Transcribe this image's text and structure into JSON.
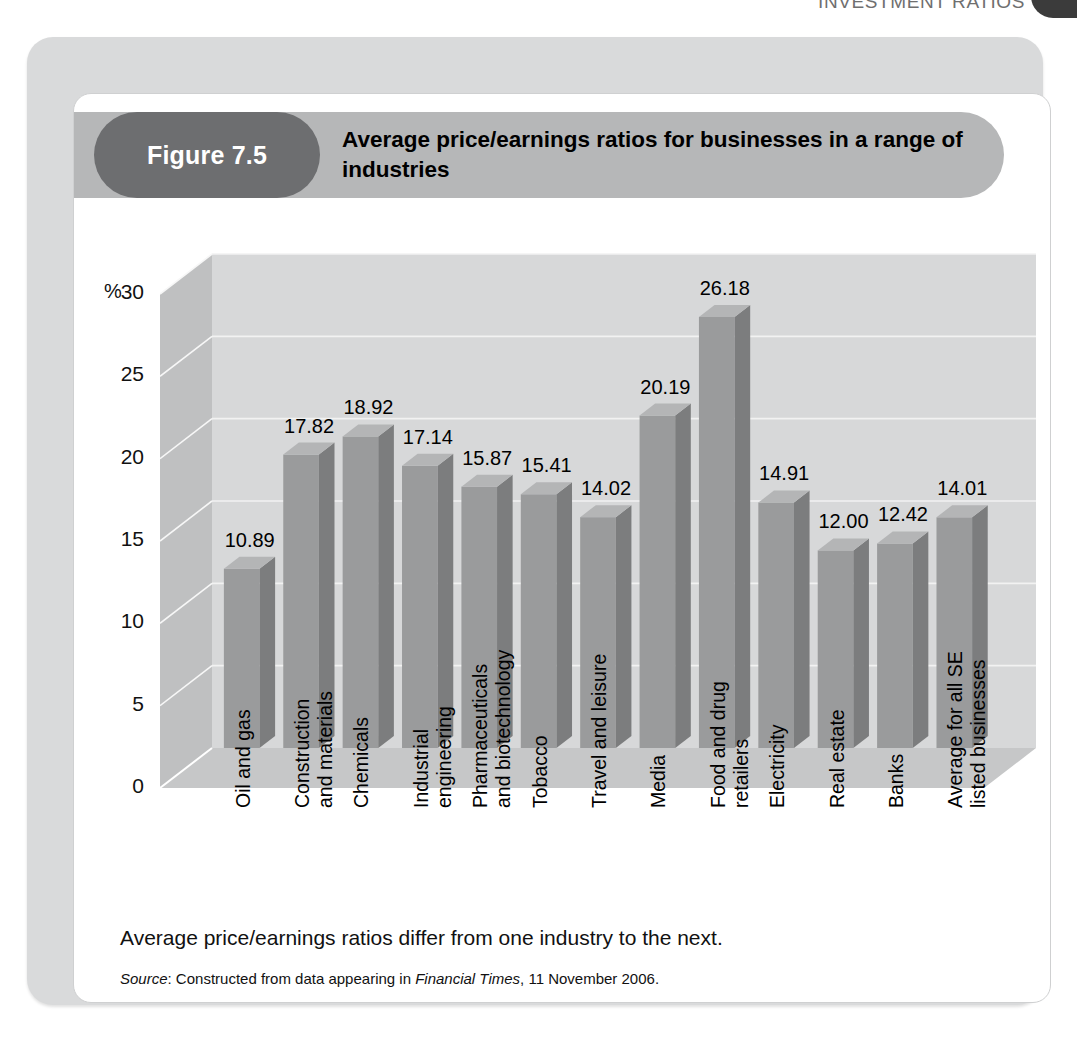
{
  "running_head": {
    "text": "INVESTMENT RATIOS"
  },
  "figure": {
    "number_label": "Figure 7.5",
    "title": "Average price/earnings ratios for businesses in a range of industries",
    "caption": "Average price/earnings ratios differ from one industry to the next.",
    "source_prefix": "Source",
    "source_mid": ": Constructed from data appearing in ",
    "source_publication": "Financial Times",
    "source_suffix": ", 11 November 2006."
  },
  "colors": {
    "outer_frame": "#d9dadb",
    "banner": "#b6b7b8",
    "pill": "#6d6e70",
    "bar_front": "#9a9b9c",
    "bar_side": "#7c7d7e",
    "bar_top": "#b4b5b6",
    "plot_back": "#d7d8d9",
    "plot_floor": "#c6c7c8",
    "plot_wall": "#bfc0c1"
  },
  "chart_data": {
    "type": "bar",
    "title": "Average price/earnings ratios for businesses in a range of industries",
    "xlabel": "",
    "ylabel": "%",
    "ylim": [
      0,
      30
    ],
    "yticks": [
      0,
      5,
      10,
      15,
      20,
      25,
      30
    ],
    "ytick_labels": [
      "0",
      "5",
      "10",
      "15",
      "20",
      "25",
      "30"
    ],
    "grid": true,
    "legend": "none",
    "categories": [
      "Oil and gas",
      "Construction and materials",
      "Chemicals",
      "Industrial engineering",
      "Pharmaceuticals and biotechnology",
      "Tobacco",
      "Travel and leisure",
      "Media",
      "Food and drug retailers",
      "Electricity",
      "Real estate",
      "Banks",
      "Average for all SE listed businesses"
    ],
    "category_lines": [
      [
        "Oil and gas"
      ],
      [
        "Construction",
        "and  materials"
      ],
      [
        "Chemicals"
      ],
      [
        "Industrial",
        "engineering"
      ],
      [
        "Pharmaceuticals",
        "and biotechnology"
      ],
      [
        "Tobacco"
      ],
      [
        "Travel and leisure"
      ],
      [
        "Media"
      ],
      [
        "Food and drug",
        "retailers"
      ],
      [
        "Electricity"
      ],
      [
        "Real estate"
      ],
      [
        "Banks"
      ],
      [
        "Average for all SE",
        "listed businesses"
      ]
    ],
    "values": [
      10.89,
      17.82,
      18.92,
      17.14,
      15.87,
      15.41,
      14.02,
      20.19,
      26.18,
      14.91,
      12.0,
      12.42,
      14.01
    ],
    "value_labels": [
      "10.89",
      "17.82",
      "18.92",
      "17.14",
      "15.87",
      "15.41",
      "14.02",
      "20.19",
      "26.18",
      "14.91",
      "12.00",
      "12.42",
      "14.01"
    ]
  }
}
